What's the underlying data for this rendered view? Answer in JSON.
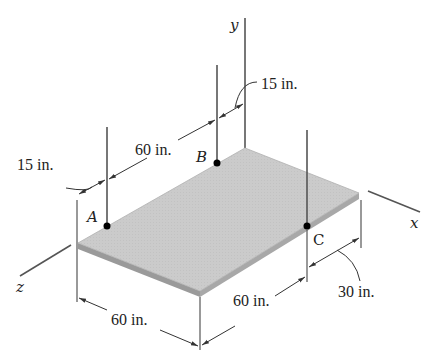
{
  "figure": {
    "type": "isometric statics diagram",
    "colors": {
      "plate_top": "#c9c9c9",
      "plate_edge": "#9a9a9a",
      "lines": "#555555",
      "text": "#222222",
      "points": "#000000"
    },
    "axes": {
      "x": "x",
      "y": "y",
      "z": "z"
    },
    "points": {
      "A": "A",
      "B": "B",
      "C": "C"
    },
    "dimensions": {
      "left_offset": "15 in.",
      "a_to_b": "60 in.",
      "b_offset": "15 in.",
      "front_left_edge": "60 in.",
      "front_right_edge": "60 in.",
      "c_offset": "30 in."
    }
  }
}
